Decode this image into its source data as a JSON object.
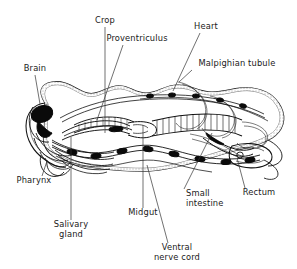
{
  "figure": {
    "kind": "labeled-anatomical-line-diagram",
    "background_color": "#ffffff",
    "ink_color": "#111111",
    "leader_color": "#333333",
    "width": 297,
    "height": 269
  },
  "labels": [
    {
      "id": "crop",
      "text": "Crop",
      "text_x": 105,
      "text_y": 23,
      "anchor": "middle",
      "leader": {
        "x1": 105,
        "y1": 27,
        "x2": 105,
        "y2": 133
      }
    },
    {
      "id": "proventriculus",
      "text": "Proventriculus",
      "text_x": 137,
      "text_y": 41,
      "anchor": "middle",
      "leader": {
        "x1": 123,
        "y1": 45,
        "x2": 97,
        "y2": 120
      }
    },
    {
      "id": "heart",
      "text": "Heart",
      "text_x": 206,
      "text_y": 29,
      "anchor": "middle",
      "leader": {
        "x1": 200,
        "y1": 33,
        "x2": 173,
        "y2": 91
      }
    },
    {
      "id": "malpighian_tubule",
      "text": "Malpighian tubule",
      "text_x": 237,
      "text_y": 66,
      "anchor": "middle",
      "leader": {
        "x1": 192,
        "y1": 70,
        "x2": 179,
        "y2": 82
      }
    },
    {
      "id": "brain",
      "text": "Brain",
      "text_x": 35,
      "text_y": 71,
      "anchor": "middle",
      "leader": {
        "x1": 35,
        "y1": 75,
        "x2": 40,
        "y2": 104
      }
    },
    {
      "id": "pharynx",
      "text": "Pharynx",
      "text_x": 34,
      "text_y": 183,
      "anchor": "middle",
      "leader": {
        "x1": 42,
        "y1": 176,
        "x2": 47,
        "y2": 161
      }
    },
    {
      "id": "salivary_gland",
      "text": "Salivary",
      "text_x": 71,
      "text_y": 227,
      "anchor": "middle",
      "text2": "gland",
      "text2_x": 71,
      "text2_y": 237,
      "leader": {
        "x1": 71,
        "y1": 220,
        "x2": 71,
        "y2": 137
      }
    },
    {
      "id": "midgut",
      "text": "Midgut",
      "text_x": 143,
      "text_y": 215,
      "anchor": "middle",
      "leader": {
        "x1": 143,
        "y1": 208,
        "x2": 143,
        "y2": 125
      }
    },
    {
      "id": "small_intestine",
      "text": "Small",
      "text_x": 186,
      "text_y": 196,
      "text2": "intestine",
      "text2_x": 186,
      "text2_y": 206,
      "anchor": "start",
      "leader": {
        "x1": 184,
        "y1": 189,
        "x2": 212,
        "y2": 133
      }
    },
    {
      "id": "rectum",
      "text": "Rectum",
      "text_x": 259,
      "text_y": 195,
      "anchor": "middle",
      "leader": {
        "x1": 245,
        "y1": 188,
        "x2": 237,
        "y2": 158
      }
    },
    {
      "id": "ventral_nerve_cord",
      "text": "Ventral",
      "text_x": 177,
      "text_y": 250,
      "text2": "nerve cord",
      "text2_x": 177,
      "text2_y": 260,
      "anchor": "middle",
      "leader": {
        "x1": 168,
        "y1": 243,
        "x2": 147,
        "y2": 165
      }
    }
  ],
  "structures": [
    {
      "id": "body-wall",
      "name": "body wall (stippled cuticle outline)"
    },
    {
      "id": "brain-ganglion",
      "name": "brain (solid black)"
    },
    {
      "id": "pharynx-tube",
      "name": "pharynx"
    },
    {
      "id": "salivary-glands",
      "name": "salivary glands"
    },
    {
      "id": "crop-sac",
      "name": "crop"
    },
    {
      "id": "proventriculus-valve",
      "name": "proventriculus"
    },
    {
      "id": "midgut-tube",
      "name": "midgut (stippled tube)"
    },
    {
      "id": "malpighian-tubules",
      "name": "Malpighian tubules (looping)"
    },
    {
      "id": "small-intestine-tube",
      "name": "small intestine"
    },
    {
      "id": "rectum-sac",
      "name": "rectum"
    },
    {
      "id": "dorsal-heart",
      "name": "dorsal vessel / heart"
    },
    {
      "id": "nerve-cord",
      "name": "ventral nerve cord with ganglia"
    }
  ]
}
